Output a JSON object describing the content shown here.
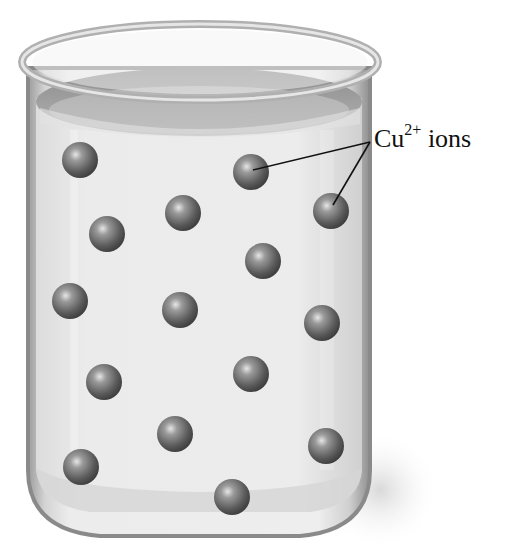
{
  "figure": {
    "label": {
      "species": "Cu",
      "charge": "2+",
      "suffix": " ions"
    },
    "colors": {
      "background": "#ffffff",
      "glass": "#b8b8b8",
      "solution": "#e8e8e8",
      "ion": "#707070",
      "leader_line": "#111111"
    },
    "ions": [
      {
        "x": 80,
        "y": 160
      },
      {
        "x": 251,
        "y": 172
      },
      {
        "x": 331,
        "y": 211
      },
      {
        "x": 183,
        "y": 213
      },
      {
        "x": 107,
        "y": 234
      },
      {
        "x": 263,
        "y": 261
      },
      {
        "x": 70,
        "y": 301
      },
      {
        "x": 180,
        "y": 310
      },
      {
        "x": 322,
        "y": 323
      },
      {
        "x": 104,
        "y": 382
      },
      {
        "x": 251,
        "y": 374
      },
      {
        "x": 175,
        "y": 434
      },
      {
        "x": 326,
        "y": 446
      },
      {
        "x": 81,
        "y": 467
      },
      {
        "x": 232,
        "y": 497
      }
    ],
    "leader_lines": [
      {
        "from": [
          370,
          142
        ],
        "to": [
          253,
          170
        ]
      },
      {
        "from": [
          370,
          142
        ],
        "to": [
          333,
          205
        ]
      }
    ]
  }
}
